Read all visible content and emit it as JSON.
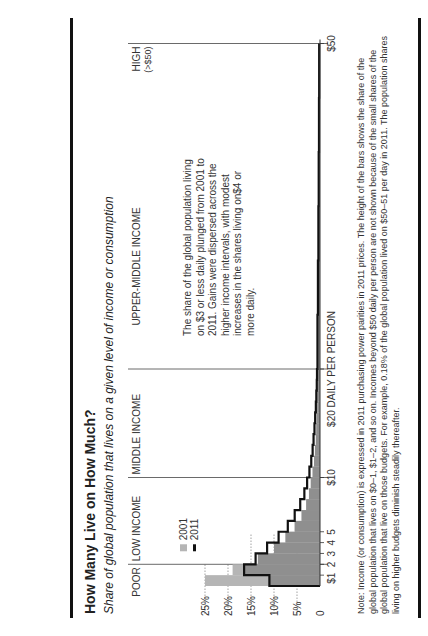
{
  "title": "How Many Live on How Much?",
  "subtitle": "Share of global population that lives on a given level of income or consumption",
  "bands": [
    {
      "label": "POOR"
    },
    {
      "label": "LOW INCOME"
    },
    {
      "label": "MIDDLE INCOME"
    },
    {
      "label": "UPPER-MIDDLE INCOME"
    },
    {
      "label": "HIGH",
      "sublabel": "(>$50)"
    }
  ],
  "legend": [
    {
      "label": "2001",
      "color": "#b3b3b3"
    },
    {
      "label": "2011",
      "color": "#111111"
    }
  ],
  "annotation": "The share of the global population living on $3 or less daily plunged from 2001 to 2011. Gains were dispersed across the higher income intervals, with modest increases in the shares living on$4 or more daily.",
  "xaxis": {
    "ticks": [
      "$1",
      "2",
      "3",
      "4",
      "5",
      "$10",
      "$20 DAILY PER PERSON",
      "$50"
    ]
  },
  "yaxis": {
    "ticks": [
      "0",
      "5%",
      "10%",
      "15%",
      "20%",
      "25%"
    ]
  },
  "note": "Note: Income (or consumption) is expressed in 2011 purchasing power parities in 2011 prices. The height of the bars shows the share of the global population that lives on $0–1, $1–2, and so on. Incomes beyond $50 daily per person are not shown because of the small shares of the global population that live on those budgets. For example, 0.18% of the global population lived on $50–51 per day in 2011. The population shares living on higher budgets diminish steadily thereafter.",
  "chart_data": {
    "type": "bar",
    "title": "How Many Live on How Much?",
    "subtitle": "Share of global population that lives on a given level of income or consumption",
    "xlabel": "DAILY PER PERSON (income, $)",
    "ylabel": "Share of global population (%)",
    "ylim": [
      0,
      25
    ],
    "xlim": [
      0,
      50
    ],
    "categories": [
      "$0-1",
      "$1-2",
      "$2-3",
      "$3-4",
      "$4-5",
      "$5-6",
      "$6-7",
      "$7-8",
      "$8-9",
      "$9-10",
      "$10-11",
      "$11-12",
      "$12-13",
      "$13-14",
      "$14-15",
      "$15-16",
      "$16-17",
      "$17-18",
      "$18-19",
      "$19-20",
      "$20-25",
      "$25-30",
      "$30-35",
      "$35-40",
      "$40-45",
      "$45-50"
    ],
    "series": [
      {
        "name": "2001",
        "style": "gray filled bars",
        "values": [
          25.0,
          19.0,
          13.5,
          10.0,
          7.5,
          5.5,
          4.0,
          3.0,
          2.4,
          2.0,
          1.6,
          1.3,
          1.1,
          0.9,
          0.8,
          0.7,
          0.6,
          0.55,
          0.5,
          0.45,
          0.38,
          0.3,
          0.25,
          0.2,
          0.17,
          0.15
        ]
      },
      {
        "name": "2011",
        "style": "black outline step",
        "values": [
          11.0,
          16.5,
          14.0,
          11.5,
          9.0,
          7.0,
          5.5,
          4.3,
          3.4,
          2.8,
          2.3,
          1.9,
          1.6,
          1.4,
          1.2,
          1.05,
          0.9,
          0.8,
          0.7,
          0.65,
          0.55,
          0.45,
          0.35,
          0.28,
          0.22,
          0.18
        ]
      }
    ],
    "bands": [
      {
        "label": "POOR",
        "range": "$0-2"
      },
      {
        "label": "LOW INCOME",
        "range": "$2-10"
      },
      {
        "label": "MIDDLE INCOME",
        "range": "$10-20"
      },
      {
        "label": "UPPER-MIDDLE INCOME",
        "range": "$20-50"
      },
      {
        "label": "HIGH (>$50)",
        "range": ">$50"
      }
    ],
    "x_ticks": [
      "$1",
      "2",
      "3",
      "4",
      "5",
      "$10",
      "$20",
      "$50"
    ],
    "y_ticks": [
      "0",
      "5%",
      "10%",
      "15%",
      "20%",
      "25%"
    ],
    "grid": "dotted horizontal reference lines at 5%, 10%, 15%, 20%, 25%",
    "legend_position": "upper left inside plot"
  }
}
